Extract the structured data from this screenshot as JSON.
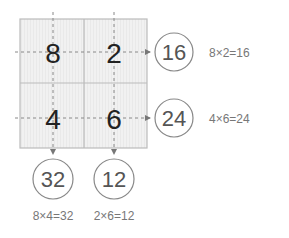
{
  "grid": {
    "cells": [
      {
        "value": "8"
      },
      {
        "value": "2"
      },
      {
        "value": "4"
      },
      {
        "value": "6"
      }
    ]
  },
  "row_products": [
    {
      "result": "16",
      "equation": "8×2=16"
    },
    {
      "result": "24",
      "equation": "4×6=24"
    }
  ],
  "col_products": [
    {
      "result": "32",
      "equation": "8×4=32"
    },
    {
      "result": "12",
      "equation": "2×6=12"
    }
  ],
  "colors": {
    "grid_fill": "#eeeeee",
    "grid_stroke": "#bbbbbb",
    "dash": "#888888",
    "circle_stroke": "#888888"
  }
}
